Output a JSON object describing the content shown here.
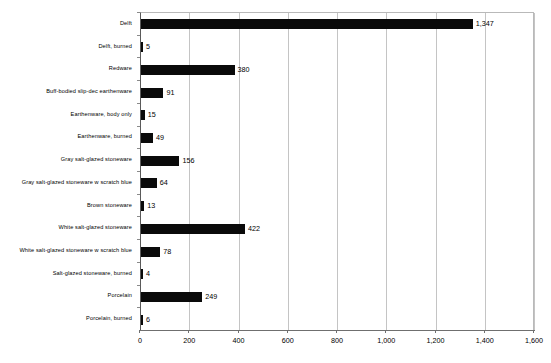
{
  "chart_data": {
    "type": "bar",
    "orientation": "horizontal",
    "title": "",
    "subtitle": "",
    "xlabel": "",
    "ylabel": "",
    "xlim": [
      0,
      1600
    ],
    "xticks": [
      0,
      200,
      400,
      600,
      800,
      1000,
      1200,
      1400,
      1600
    ],
    "xtick_labels": [
      "0",
      "200",
      "400",
      "600",
      "800",
      "1,000",
      "1,200",
      "1,400",
      "1,600"
    ],
    "grid": "vertical",
    "legend": "none",
    "bar_color": "#0a0a0a",
    "gridline_color": "#c4c4c4",
    "axis_color": "#6f6f6f",
    "categories": [
      "Delft",
      "Delft, burned",
      "Redware",
      "Buff-bodied slip-dec earthenware",
      "Earthenware, body only",
      "Earthenware, burned",
      "Gray salt-glazed stoneware",
      "Gray salt-glazed stoneware w scratch blue",
      "Brown stoneware",
      "White salt-glazed stoneware",
      "White salt-glazed stoneware w scratch blue",
      "Salt-glazed stoneware, burned",
      "Porcelain",
      "Porcelain, burned"
    ],
    "values": [
      1347,
      5,
      380,
      91,
      15,
      49,
      156,
      64,
      13,
      422,
      78,
      4,
      249,
      6
    ],
    "value_labels": [
      "1,347",
      "5",
      "380",
      "91",
      "15",
      "49",
      "156",
      "64",
      "13",
      "422",
      "78",
      "4",
      "249",
      "6"
    ]
  }
}
